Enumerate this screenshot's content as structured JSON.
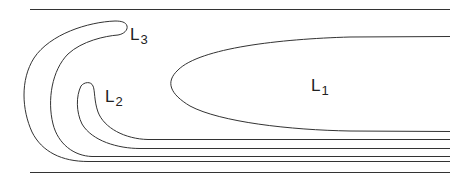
{
  "diagram": {
    "title": "",
    "stroke_color": "#333333",
    "background": "#ffffff",
    "labels": [
      {
        "id": "L1",
        "main": "L",
        "sub": "1"
      },
      {
        "id": "L2",
        "main": "L",
        "sub": "2"
      },
      {
        "id": "L3",
        "main": "L",
        "sub": "3"
      }
    ],
    "elements": [
      {
        "name": "top-boundary-line",
        "type": "line"
      },
      {
        "name": "bottom-boundary-line",
        "type": "line"
      },
      {
        "name": "region-L1",
        "type": "elongated-loop",
        "label": "L1"
      },
      {
        "name": "region-L2",
        "type": "hook-loop",
        "label": "L2"
      },
      {
        "name": "region-L3",
        "type": "hook-loop",
        "label": "L3"
      }
    ]
  }
}
